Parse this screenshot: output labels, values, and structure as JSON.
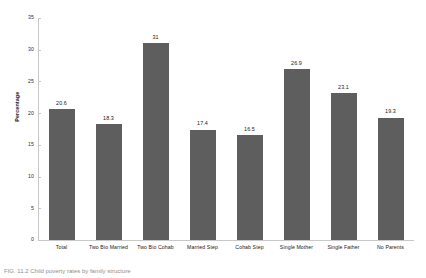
{
  "chart_data": {
    "type": "bar",
    "title": "",
    "xlabel": "",
    "ylabel": "Percentage",
    "ylim": [
      0,
      35
    ],
    "yticks": [
      0,
      5,
      10,
      15,
      20,
      25,
      30,
      35
    ],
    "grid": false,
    "legend": null,
    "bar_color": "#5e5e5e",
    "categories": [
      "Total",
      "Two Bio Married",
      "Two Bio Cohab",
      "Married Step",
      "Cohab Step",
      "Single Mother",
      "Single Father",
      "No Parents"
    ],
    "values": [
      20.6,
      18.3,
      31,
      17.4,
      16.5,
      26.9,
      23.1,
      19.3
    ],
    "value_labels": [
      "20.6",
      "18.3",
      "31",
      "17.4",
      "16.5",
      "26.9",
      "23.1",
      "19.3"
    ]
  },
  "axis": {
    "y_title": "Percentage",
    "y_tick_labels": [
      "0",
      "5",
      "10",
      "15",
      "20",
      "25",
      "30",
      "35"
    ]
  },
  "caption": {
    "text": "FIG. 11.2  Child poverty rates by family structure"
  }
}
